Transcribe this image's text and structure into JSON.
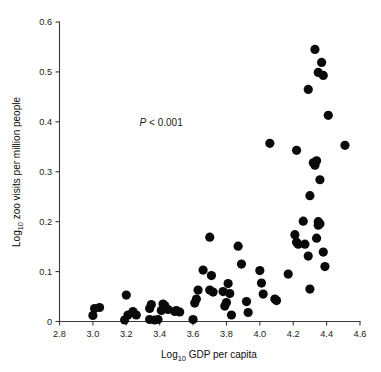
{
  "chart_data": {
    "type": "scatter",
    "title": "",
    "xlabel": "Log10 GDP per capita",
    "ylabel": "Log10 zoo visits per million people",
    "xlabel_base": "Log",
    "xlabel_sub": "10",
    "xlabel_rest": " GDP per capita",
    "ylabel_base": "Log",
    "ylabel_sub": "10",
    "ylabel_rest": " zoo visits per million people",
    "xlim": [
      2.8,
      4.6
    ],
    "ylim": [
      0,
      0.6
    ],
    "xticks": [
      2.8,
      3.0,
      3.2,
      3.4,
      3.6,
      3.8,
      4.0,
      4.2,
      4.4,
      4.6
    ],
    "xticklabels": [
      "2.8",
      "3.0",
      "3.2",
      "3.4",
      "3.6",
      "3.8",
      "4.0",
      "4.2",
      "4.4",
      "4.6"
    ],
    "yticks": [
      0,
      0.1,
      0.2,
      0.3,
      0.4,
      0.5,
      0.6
    ],
    "yticklabels": [
      "0",
      "0.1",
      "0.2",
      "0.3",
      "0.4",
      "0.5",
      "0.6"
    ],
    "grid": false,
    "legend": null,
    "marker": "circle",
    "marker_color": "#0a0a0a",
    "marker_size": 4.6,
    "annotation": "P < 0.001",
    "annotation_p": "P",
    "annotation_rest": " < 0.001",
    "annotation_x": 3.28,
    "annotation_y": 0.392,
    "points": [
      [
        3.0,
        0.012
      ],
      [
        3.01,
        0.026
      ],
      [
        3.04,
        0.028
      ],
      [
        3.19,
        0.003
      ],
      [
        3.2,
        0.053
      ],
      [
        3.21,
        0.013
      ],
      [
        3.24,
        0.02
      ],
      [
        3.26,
        0.013
      ],
      [
        3.34,
        0.004
      ],
      [
        3.34,
        0.026
      ],
      [
        3.35,
        0.034
      ],
      [
        3.37,
        0.003
      ],
      [
        3.39,
        0.004
      ],
      [
        3.41,
        0.022
      ],
      [
        3.42,
        0.035
      ],
      [
        3.43,
        0.032
      ],
      [
        3.45,
        0.024
      ],
      [
        3.49,
        0.02
      ],
      [
        3.5,
        0.022
      ],
      [
        3.52,
        0.019
      ],
      [
        3.6,
        0.004
      ],
      [
        3.61,
        0.037
      ],
      [
        3.62,
        0.045
      ],
      [
        3.63,
        0.063
      ],
      [
        3.66,
        0.103
      ],
      [
        3.7,
        0.169
      ],
      [
        3.7,
        0.063
      ],
      [
        3.71,
        0.092
      ],
      [
        3.72,
        0.059
      ],
      [
        3.78,
        0.06
      ],
      [
        3.79,
        0.031
      ],
      [
        3.8,
        0.038
      ],
      [
        3.81,
        0.076
      ],
      [
        3.82,
        0.056
      ],
      [
        3.83,
        0.013
      ],
      [
        3.87,
        0.151
      ],
      [
        3.89,
        0.115
      ],
      [
        3.92,
        0.04
      ],
      [
        3.93,
        0.018
      ],
      [
        4.0,
        0.102
      ],
      [
        4.01,
        0.077
      ],
      [
        4.02,
        0.055
      ],
      [
        4.06,
        0.357
      ],
      [
        4.09,
        0.045
      ],
      [
        4.1,
        0.042
      ],
      [
        4.17,
        0.095
      ],
      [
        4.21,
        0.174
      ],
      [
        4.22,
        0.343
      ],
      [
        4.22,
        0.159
      ],
      [
        4.23,
        0.155
      ],
      [
        4.26,
        0.201
      ],
      [
        4.27,
        0.155
      ],
      [
        4.29,
        0.465
      ],
      [
        4.29,
        0.131
      ],
      [
        4.3,
        0.252
      ],
      [
        4.3,
        0.065
      ],
      [
        4.32,
        0.318
      ],
      [
        4.33,
        0.545
      ],
      [
        4.33,
        0.313
      ],
      [
        4.34,
        0.322
      ],
      [
        4.34,
        0.167
      ],
      [
        4.35,
        0.499
      ],
      [
        4.35,
        0.2
      ],
      [
        4.35,
        0.193
      ],
      [
        4.36,
        0.284
      ],
      [
        4.36,
        0.196
      ],
      [
        4.37,
        0.519
      ],
      [
        4.38,
        0.493
      ],
      [
        4.38,
        0.139
      ],
      [
        4.39,
        0.11
      ],
      [
        4.41,
        0.413
      ],
      [
        4.51,
        0.353
      ]
    ]
  }
}
